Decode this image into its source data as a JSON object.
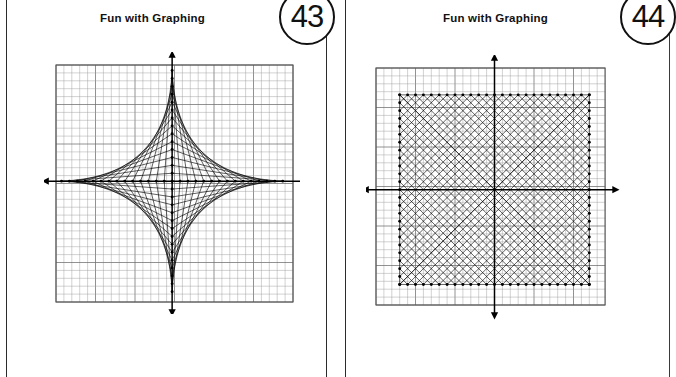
{
  "document": {
    "kind": "worksheet-scan",
    "page_count": 2,
    "background_color": "#ffffff",
    "ink_color": "#000000"
  },
  "pages": [
    {
      "id": "page-43",
      "title": "Fun with Graphing",
      "number": "43",
      "figure": {
        "name": "hyperbola-string-art",
        "type": "line-envelope",
        "axes": {
          "x_arrows": "both",
          "y_arrows": "both"
        },
        "grid": {
          "cells_x": 30,
          "cells_y": 30,
          "major_every": 5,
          "visible": true
        },
        "nodes_per_axis_arm": 14,
        "quadrants": [
          "I",
          "II",
          "III",
          "IV"
        ],
        "envelope": "hyperbola"
      }
    },
    {
      "id": "page-44",
      "title": "Fun with Graphing",
      "number": "44",
      "figure": {
        "name": "square-circle-string-art",
        "type": "line-envelope",
        "axes": {
          "x_arrows": "both",
          "y_arrows": "both"
        },
        "grid": {
          "cells_x": 29,
          "cells_y": 30,
          "major_every": 5,
          "visible": true
        },
        "nodes_per_side": 24,
        "sides": [
          "top",
          "right",
          "bottom",
          "left"
        ],
        "envelope": "circle-astroid"
      }
    }
  ],
  "chart_data": [
    {
      "type": "line",
      "title": "Fun with Graphing",
      "subtitle": "43",
      "xlabel": "",
      "ylabel": "",
      "xlim": [
        -15,
        15
      ],
      "ylim": [
        -15,
        15
      ],
      "grid": true,
      "legend": "none",
      "construction": "hyperbola-envelope",
      "description": "Segments join the point (0, k) on one axis to the point (n-k, 0) on the perpendicular axis for k = 1..n, repeated in all four quadrants; the family of chords envelopes a hyperbola in each quadrant.",
      "n": 14,
      "series": [
        {
          "name": "quadrant-I",
          "segments": [
            {
              "k": 1,
              "from": [
                0,
                14
              ],
              "to": [
                1,
                0
              ]
            },
            {
              "k": 2,
              "from": [
                0,
                13
              ],
              "to": [
                2,
                0
              ]
            },
            {
              "k": 3,
              "from": [
                0,
                12
              ],
              "to": [
                3,
                0
              ]
            },
            {
              "k": 4,
              "from": [
                0,
                11
              ],
              "to": [
                4,
                0
              ]
            },
            {
              "k": 5,
              "from": [
                0,
                10
              ],
              "to": [
                5,
                0
              ]
            },
            {
              "k": 6,
              "from": [
                0,
                9
              ],
              "to": [
                6,
                0
              ]
            },
            {
              "k": 7,
              "from": [
                0,
                8
              ],
              "to": [
                7,
                0
              ]
            },
            {
              "k": 8,
              "from": [
                0,
                7
              ],
              "to": [
                8,
                0
              ]
            },
            {
              "k": 9,
              "from": [
                0,
                6
              ],
              "to": [
                9,
                0
              ]
            },
            {
              "k": 10,
              "from": [
                0,
                5
              ],
              "to": [
                10,
                0
              ]
            },
            {
              "k": 11,
              "from": [
                0,
                4
              ],
              "to": [
                11,
                0
              ]
            },
            {
              "k": 12,
              "from": [
                0,
                3
              ],
              "to": [
                12,
                0
              ]
            },
            {
              "k": 13,
              "from": [
                0,
                2
              ],
              "to": [
                13,
                0
              ]
            },
            {
              "k": 14,
              "from": [
                0,
                1
              ],
              "to": [
                14,
                0
              ]
            }
          ]
        },
        {
          "name": "quadrant-II",
          "mirror_of": "quadrant-I",
          "reflect": "x"
        },
        {
          "name": "quadrant-III",
          "mirror_of": "quadrant-I",
          "reflect": "xy"
        },
        {
          "name": "quadrant-IV",
          "mirror_of": "quadrant-I",
          "reflect": "y"
        }
      ],
      "markers": {
        "shape": "dot",
        "on": "axis lattice points",
        "x_axis_points": [
          -14,
          -13,
          -12,
          -11,
          -10,
          -9,
          -8,
          -7,
          -6,
          -5,
          -4,
          -3,
          -2,
          -1,
          0,
          1,
          2,
          3,
          4,
          5,
          6,
          7,
          8,
          9,
          10,
          11,
          12,
          13,
          14
        ],
        "y_axis_points": [
          -14,
          -13,
          -12,
          -11,
          -10,
          -9,
          -8,
          -7,
          -6,
          -5,
          -4,
          -3,
          -2,
          -1,
          0,
          1,
          2,
          3,
          4,
          5,
          6,
          7,
          8,
          9,
          10,
          11,
          12,
          13,
          14
        ]
      }
    },
    {
      "type": "line",
      "title": "Fun with Graphing",
      "subtitle": "44",
      "xlabel": "",
      "ylabel": "",
      "xlim": [
        -14.5,
        14.5
      ],
      "ylim": [
        -15,
        15
      ],
      "grid": true,
      "legend": "none",
      "construction": "square-corner-envelope",
      "description": "A square of half-width 12 is marked with 24 equally spaced nodes per side. At each corner the nodes of one side are joined to the nodes of the adjacent side in reverse order, so the four chord families envelope arcs that together read as a circle inscribed in the square.",
      "square": {
        "x_min": -12,
        "x_max": 12,
        "y_min": -12,
        "y_max": 12
      },
      "nodes_per_side": 24,
      "node_spacing": 1,
      "corner_families": [
        {
          "corner": "top-left",
          "from_side": "top",
          "to_side": "left"
        },
        {
          "corner": "top-right",
          "from_side": "top",
          "to_side": "right"
        },
        {
          "corner": "bottom-right",
          "from_side": "bottom",
          "to_side": "right"
        },
        {
          "corner": "bottom-left",
          "from_side": "bottom",
          "to_side": "left"
        }
      ],
      "envelope_radius": 12,
      "markers": {
        "shape": "dot",
        "on": "square perimeter"
      }
    }
  ]
}
